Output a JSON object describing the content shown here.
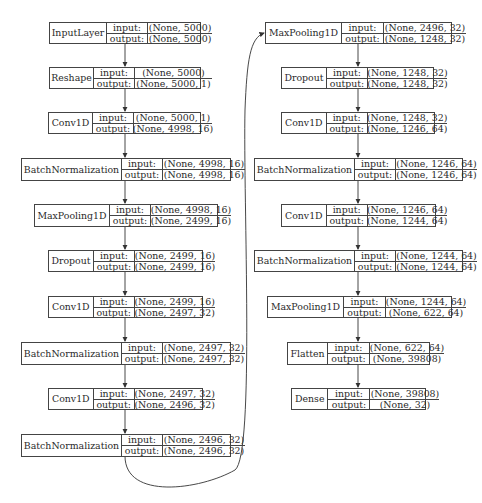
{
  "diagram": {
    "type": "keras-model-plot",
    "labels": {
      "input": "input:",
      "output": "output:"
    },
    "left_column": [
      {
        "layer": "InputLayer",
        "input": "(None, 5000)",
        "output": "(None, 5000)"
      },
      {
        "layer": "Reshape",
        "input": "(None, 5000)",
        "output": "(None, 5000, 1)"
      },
      {
        "layer": "Conv1D",
        "input": "(None, 5000, 1)",
        "output": "(None, 4998, 16)"
      },
      {
        "layer": "BatchNormalization",
        "input": "(None, 4998, 16)",
        "output": "(None, 4998, 16)"
      },
      {
        "layer": "MaxPooling1D",
        "input": "(None, 4998, 16)",
        "output": "(None, 2499, 16)"
      },
      {
        "layer": "Dropout",
        "input": "(None, 2499, 16)",
        "output": "(None, 2499, 16)"
      },
      {
        "layer": "Conv1D",
        "input": "(None, 2499, 16)",
        "output": "(None, 2497, 32)"
      },
      {
        "layer": "BatchNormalization",
        "input": "(None, 2497, 32)",
        "output": "(None, 2497, 32)"
      },
      {
        "layer": "Conv1D",
        "input": "(None, 2497, 32)",
        "output": "(None, 2496, 32)"
      },
      {
        "layer": "BatchNormalization",
        "input": "(None, 2496, 32)",
        "output": "(None, 2496, 32)"
      }
    ],
    "right_column": [
      {
        "layer": "MaxPooling1D",
        "input": "(None, 2496, 32)",
        "output": "(None, 1248, 32)"
      },
      {
        "layer": "Dropout",
        "input": "(None, 1248, 32)",
        "output": "(None, 1248, 32)"
      },
      {
        "layer": "Conv1D",
        "input": "(None, 1248, 32)",
        "output": "(None, 1246, 64)"
      },
      {
        "layer": "BatchNormalization",
        "input": "(None, 1246, 64)",
        "output": "(None, 1246, 64)"
      },
      {
        "layer": "Conv1D",
        "input": "(None, 1246, 64)",
        "output": "(None, 1244, 64)"
      },
      {
        "layer": "BatchNormalization",
        "input": "(None, 1244, 64)",
        "output": "(None, 1244, 64)"
      },
      {
        "layer": "MaxPooling1D",
        "input": "(None, 1244, 64)",
        "output": "(None, 622, 64)"
      },
      {
        "layer": "Flatten",
        "input": "(None, 622, 64)",
        "output": "(None, 39808)"
      },
      {
        "layer": "Dense",
        "input": "(None, 39808)",
        "output": "(None, 32)"
      }
    ]
  }
}
